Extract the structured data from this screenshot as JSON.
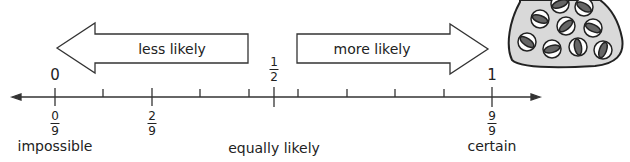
{
  "arrows": {
    "left": {
      "label": "less likely"
    },
    "right": {
      "label": "more likely"
    }
  },
  "top_labels": {
    "zero": "0",
    "half": {
      "num": "1",
      "den": "2"
    },
    "one": "1"
  },
  "fractions": [
    {
      "num": "0",
      "den": "9"
    },
    {
      "num": "2",
      "den": "9"
    },
    {
      "num": "9",
      "den": "9"
    }
  ],
  "bottom_labels": {
    "impossible": "impossible",
    "equally_likely": "equally likely",
    "certain": "certain"
  },
  "number_line": {
    "tick_count_ninths": 10,
    "range": [
      0,
      1
    ],
    "half_mark": 0.5
  },
  "bag": {
    "marble_count": 10,
    "fill": "#d9d9d9",
    "marble_color": "#555555"
  }
}
